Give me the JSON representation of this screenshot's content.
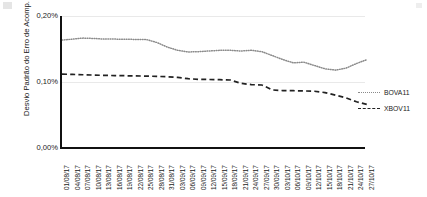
{
  "chart_data": {
    "type": "line",
    "title": "",
    "xlabel": "",
    "ylabel": "Desvio Padrão do Erro de Acomp.",
    "ylim": [
      0,
      0.2
    ],
    "yticks": [
      "0,00%",
      "0,10%",
      "0,20%"
    ],
    "ytick_values": [
      0,
      0.1,
      0.2
    ],
    "grid": true,
    "legend_position": "right",
    "categories": [
      "01/08/17",
      "04/08/17",
      "07/08/17",
      "10/08/17",
      "13/08/17",
      "16/08/17",
      "19/08/17",
      "22/08/17",
      "25/08/17",
      "28/08/17",
      "31/08/17",
      "03/09/17",
      "06/09/17",
      "09/09/17",
      "12/09/17",
      "15/09/17",
      "18/09/17",
      "21/09/17",
      "24/09/17",
      "27/09/17",
      "30/09/17",
      "03/10/17",
      "06/10/17",
      "09/10/17",
      "12/10/17",
      "15/10/17",
      "18/10/17",
      "21/10/17",
      "24/10/17",
      "27/10/17"
    ],
    "series": [
      {
        "name": "BOVA11",
        "style": "dotted",
        "color": "#8a8a8a",
        "values": [
          0.1635,
          0.165,
          0.1665,
          0.166,
          0.165,
          0.165,
          0.1648,
          0.1645,
          0.1645,
          0.16,
          0.153,
          0.148,
          0.1455,
          0.146,
          0.147,
          0.148,
          0.148,
          0.147,
          0.148,
          0.146,
          0.14,
          0.134,
          0.129,
          0.13,
          0.125,
          0.12,
          0.118,
          0.121,
          0.128,
          0.134
        ]
      },
      {
        "name": "XBOV11",
        "style": "dashed",
        "color": "#222222",
        "values": [
          0.112,
          0.1115,
          0.111,
          0.1105,
          0.11,
          0.1098,
          0.1095,
          0.1092,
          0.109,
          0.1085,
          0.108,
          0.107,
          0.105,
          0.104,
          0.1038,
          0.1035,
          0.103,
          0.098,
          0.096,
          0.0955,
          0.088,
          0.087,
          0.0868,
          0.0865,
          0.086,
          0.084,
          0.08,
          0.076,
          0.07,
          0.066
        ]
      }
    ]
  },
  "legend": {
    "items": [
      {
        "label": "BOVA11"
      },
      {
        "label": "XBOV11"
      }
    ]
  }
}
